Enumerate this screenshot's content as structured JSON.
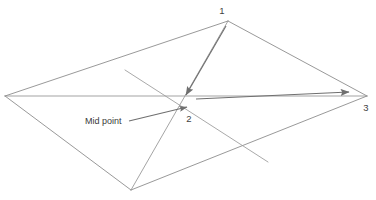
{
  "figure": {
    "background_color": "#ffffff",
    "line_color": "#8a8a8a",
    "arrow_color": "#6a6a6a",
    "text_color": "#3a3a3a",
    "canvas": {
      "width": 376,
      "height": 200
    }
  },
  "labels": {
    "vertex_1": "1",
    "vertex_2": "2",
    "vertex_3": "3",
    "mid_point": "Mid point"
  },
  "geometry": {
    "points": {
      "top": {
        "x": 228,
        "y": 21,
        "label": "1"
      },
      "left": {
        "x": 5,
        "y": 96,
        "label": ""
      },
      "center": {
        "x": 188,
        "y": 106,
        "label": "2"
      },
      "right": {
        "x": 367,
        "y": 96,
        "label": "3"
      },
      "bottom": {
        "x": 131,
        "y": 190,
        "label": ""
      }
    },
    "outline_edges": [
      {
        "from": "left",
        "to": "top"
      },
      {
        "from": "top",
        "to": "right"
      },
      {
        "from": "right",
        "to": "bottom"
      },
      {
        "from": "bottom",
        "to": "left"
      }
    ],
    "diagonals": [
      {
        "from": "left",
        "to": "right"
      },
      {
        "from": "top",
        "to": "bottom"
      }
    ],
    "cross_line": {
      "x1": 125,
      "y1": 70,
      "x2": 268,
      "y2": 162
    },
    "arrows": [
      {
        "name": "arrow-vertex1-to-midpoint",
        "x1": 226,
        "y1": 26,
        "x2": 186,
        "y2": 95
      },
      {
        "name": "arrow-midpoint-to-vertex3",
        "x1": 196,
        "y1": 99,
        "x2": 349,
        "y2": 92
      },
      {
        "name": "arrow-midpoint-leader",
        "x1": 129,
        "y1": 121,
        "x2": 187,
        "y2": 107
      }
    ]
  },
  "annotations": {
    "mid_point_label": {
      "text": "Mid point",
      "x": 85,
      "y": 124
    },
    "vertex_1_label": {
      "text": "1",
      "x": 222,
      "y": 14
    },
    "vertex_2_label": {
      "text": "2",
      "x": 189,
      "y": 122
    },
    "vertex_3_label": {
      "text": "3",
      "x": 366,
      "y": 111
    }
  }
}
